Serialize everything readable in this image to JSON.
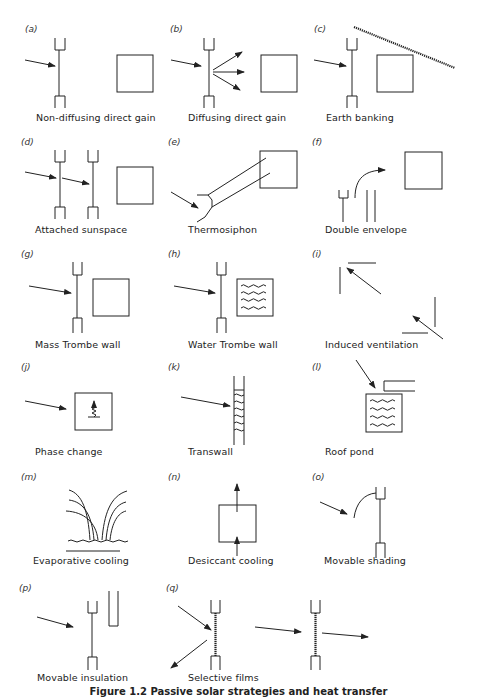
{
  "figure": {
    "caption": "Figure 1.2   Passive solar strategies and heat transfer",
    "panels": [
      {
        "tag": "(a)",
        "label": "Non-diffusing direct gain"
      },
      {
        "tag": "(b)",
        "label": "Diffusing direct gain"
      },
      {
        "tag": "(c)",
        "label": "Earth banking"
      },
      {
        "tag": "(d)",
        "label": "Attached sunspace"
      },
      {
        "tag": "(e)",
        "label": "Thermosiphon"
      },
      {
        "tag": "(f)",
        "label": "Double envelope"
      },
      {
        "tag": "(g)",
        "label": "Mass Trombe wall"
      },
      {
        "tag": "(h)",
        "label": "Water Trombe wall"
      },
      {
        "tag": "(i)",
        "label": "Induced ventilation"
      },
      {
        "tag": "(j)",
        "label": "Phase change"
      },
      {
        "tag": "(k)",
        "label": "Transwall"
      },
      {
        "tag": "(l)",
        "label": "Roof pond"
      },
      {
        "tag": "(m)",
        "label": "Evaporative cooling"
      },
      {
        "tag": "(n)",
        "label": "Desiccant cooling"
      },
      {
        "tag": "(o)",
        "label": "Movable shading"
      },
      {
        "tag": "(p)",
        "label": "Movable insulation"
      },
      {
        "tag": "(q)",
        "label": "Selective films"
      }
    ]
  },
  "colors": {
    "ink": "#222222",
    "background": "#ffffff"
  }
}
